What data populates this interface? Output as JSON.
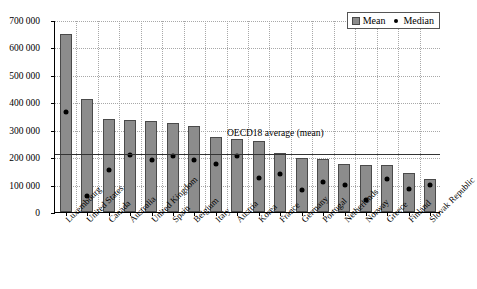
{
  "chart_data": {
    "type": "bar",
    "title": "",
    "xlabel": "",
    "ylabel": "",
    "ylim": [
      0,
      700000
    ],
    "yticks": [
      0,
      100000,
      200000,
      300000,
      400000,
      500000,
      600000,
      700000
    ],
    "ytick_labels": [
      "0",
      "100 000",
      "200 000",
      "300 000",
      "400 000",
      "500 000",
      "600 000",
      "700 000"
    ],
    "grid": true,
    "legend_position": "top-right",
    "categories": [
      "Luxembourg",
      "United States",
      "Canada",
      "Australia",
      "United Kingdom",
      "Spain",
      "Belgium",
      "Italy",
      "Austria",
      "Korea",
      "France",
      "Germany",
      "Portugal",
      "Netherlands",
      "Norway",
      "Greece",
      "Finland",
      "Slovak Republic"
    ],
    "series": [
      {
        "name": "Mean",
        "type": "bar",
        "color": "#8c8c8c",
        "values": [
          648000,
          411000,
          340000,
          337000,
          332000,
          324000,
          312000,
          274000,
          268000,
          258000,
          214000,
          196000,
          192000,
          176000,
          173000,
          171000,
          142000,
          121000
        ]
      },
      {
        "name": "Median",
        "type": "scatter",
        "color": "#000000",
        "values": [
          365000,
          58000,
          152000,
          209000,
          188000,
          206000,
          188000,
          174000,
          205000,
          124000,
          137000,
          82000,
          111000,
          98000,
          45000,
          121000,
          83000,
          100000
        ]
      }
    ],
    "annotations": [
      {
        "name": "oecd18-average-line",
        "label": "OECD18 average (mean)",
        "type": "hline",
        "value": 215000
      }
    ],
    "legend": [
      {
        "label": "Mean",
        "marker": "square",
        "color": "#8c8c8c"
      },
      {
        "label": "Median",
        "marker": "dot",
        "color": "#000000"
      }
    ]
  }
}
